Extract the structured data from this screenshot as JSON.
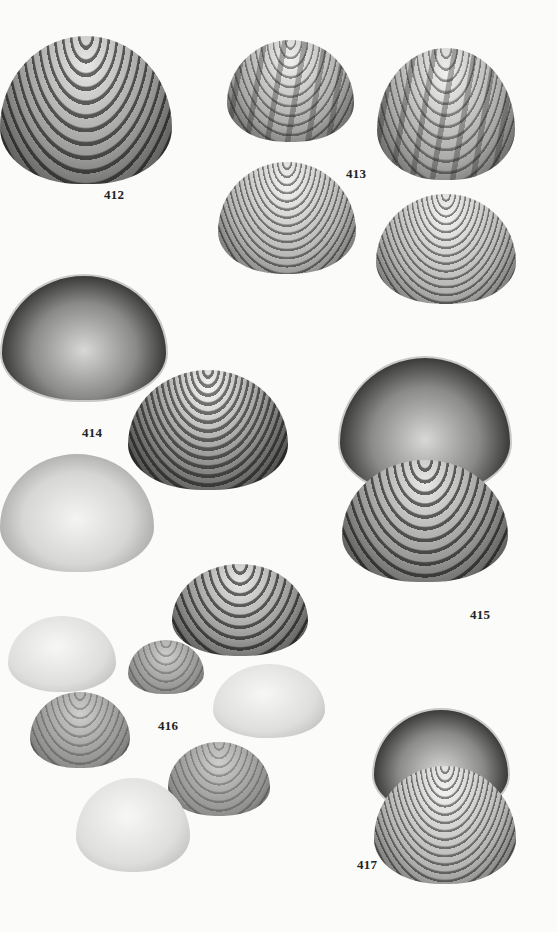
{
  "plate": {
    "description": "Book plate of bivalve (clam) shell photographs with figure numbers",
    "figures": [
      {
        "number": "412",
        "specimens": 1
      },
      {
        "number": "413",
        "specimens": 4
      },
      {
        "number": "414",
        "specimens": 3
      },
      {
        "number": "415",
        "specimens": 2
      },
      {
        "number": "416",
        "specimens": 7
      },
      {
        "number": "417",
        "specimens": 2
      }
    ]
  },
  "labels": {
    "fig412": "412",
    "fig413": "413",
    "fig414": "414",
    "fig415": "415",
    "fig416": "416",
    "fig417": "417"
  }
}
